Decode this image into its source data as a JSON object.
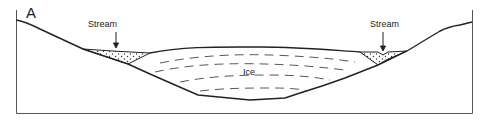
{
  "diagram": {
    "panel_label": "A",
    "labels": {
      "stream_left": "Stream",
      "stream_right": "Stream",
      "ice": "Ice"
    },
    "colors": {
      "line": "#222222",
      "frame": "#555555",
      "dash": "#444444",
      "background": "#ffffff"
    }
  }
}
